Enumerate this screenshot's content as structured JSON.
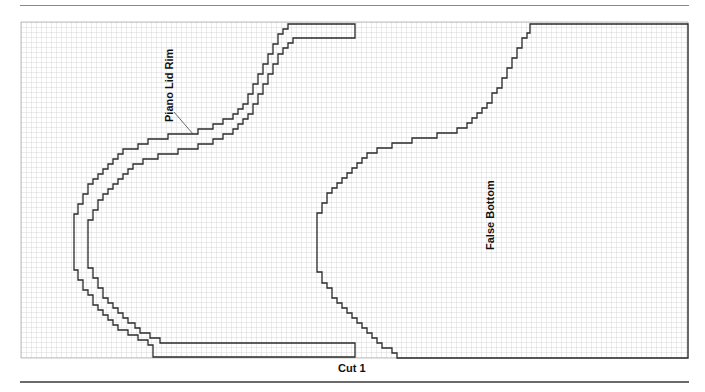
{
  "diagram": {
    "type": "cutting-layout-grid",
    "grid": {
      "columns": 133,
      "rows": 67,
      "cell_px": 5,
      "line_color": "#b8b8b8"
    },
    "pieces": [
      {
        "name": "Piano Lid Rim",
        "label": "Piano Lid Rim",
        "shape": "stepped curved strip"
      },
      {
        "name": "False Bottom",
        "label": "False Bottom",
        "shape": "stepped curved panel"
      }
    ],
    "caption": "Cut 1",
    "colors": {
      "outline": "#2a2a2a",
      "grid": "#b8b8b8",
      "rule": "#6b6b6b"
    }
  }
}
